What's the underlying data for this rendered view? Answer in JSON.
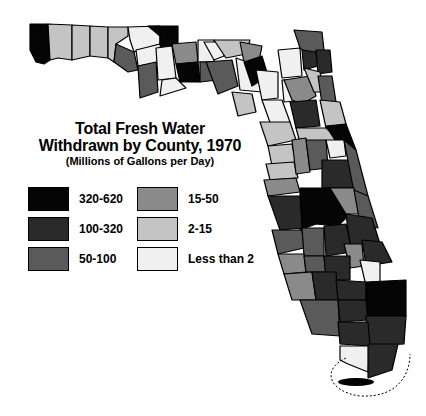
{
  "title": {
    "line1": "Total Fresh Water",
    "line2": "Withdrawn by County, 1970",
    "subtitle": "(Millions of Gallons per Day)"
  },
  "legend": {
    "items": [
      {
        "label": "320-620",
        "color": "#050505"
      },
      {
        "label": "100-320",
        "color": "#2a2a2a"
      },
      {
        "label": "50-100",
        "color": "#5a5a5a"
      },
      {
        "label": "15-50",
        "color": "#8a8a8a"
      },
      {
        "label": "2-15",
        "color": "#c4c4c4"
      },
      {
        "label": "Less than 2",
        "color": "#f0f0f0"
      }
    ]
  }
}
